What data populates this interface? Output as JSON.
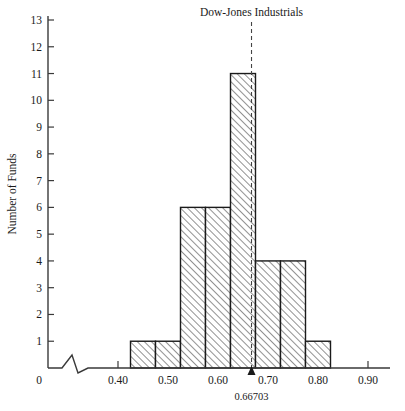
{
  "chart_data": {
    "type": "bar",
    "title": "Dow-Jones Industrials",
    "xlabel": "",
    "ylabel": "Number of Funds",
    "bin_width": 0.05,
    "bin_starts": [
      0.425,
      0.475,
      0.525,
      0.575,
      0.625,
      0.675,
      0.725,
      0.775
    ],
    "bin_ends": [
      0.475,
      0.525,
      0.575,
      0.625,
      0.675,
      0.725,
      0.775,
      0.825
    ],
    "categories": [
      "0.425-0.475",
      "0.475-0.525",
      "0.525-0.575",
      "0.575-0.625",
      "0.625-0.675",
      "0.675-0.725",
      "0.725-0.775",
      "0.775-0.825"
    ],
    "values": [
      1,
      1,
      6,
      6,
      11,
      4,
      4,
      1
    ],
    "xlim": [
      0.4,
      0.9
    ],
    "ylim": [
      0,
      13
    ],
    "x_ticks": [
      0.4,
      0.5,
      0.6,
      0.7,
      0.8,
      0.9
    ],
    "x_tick_labels": [
      "0.40",
      "0.50",
      "0.60",
      "0.70",
      "0.80",
      "0.90"
    ],
    "y_ticks": [
      1,
      2,
      3,
      4,
      5,
      6,
      7,
      8,
      9,
      10,
      11,
      12,
      13
    ],
    "y_tick_labels": [
      "1",
      "2",
      "3",
      "4",
      "5",
      "6",
      "7",
      "8",
      "9",
      "10",
      "11",
      "12",
      "13"
    ],
    "origin_label": "0",
    "grid": false,
    "legend": "none",
    "axis_break": true,
    "annotations": [
      {
        "name": "dow-jones-marker",
        "label": "Dow-Jones Industrials",
        "value_label": "0.66703",
        "value": 0.66703,
        "style": "dashed-vertical-line-with-arrow"
      }
    ],
    "colors": {
      "bar_fill": "#ffffff",
      "bar_hatch": "#6e6e6e",
      "bar_edge": "#1a1a1a",
      "axis": "#3a3a3a",
      "text": "#1a1a1a",
      "background": "#ffffff"
    }
  },
  "yaxis": {
    "title": "Number of Funds"
  },
  "xaxis": {
    "origin": "0"
  },
  "marker": {
    "title": "Dow-Jones Industrials",
    "value": "0.66703"
  }
}
